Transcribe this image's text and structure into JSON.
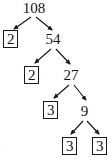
{
  "diagram": {
    "kind": "factor-tree",
    "root_value": "108",
    "ink_color": "#1a1a1a",
    "background_color": "#ffffff",
    "nodes": [
      {
        "id": "n108",
        "label": "108",
        "boxed": false,
        "prime": false,
        "level": 0,
        "x": 21,
        "y": 1,
        "w": 26,
        "h": 14
      },
      {
        "id": "n2a",
        "label": "2",
        "boxed": true,
        "prime": true,
        "level": 1,
        "x": 3,
        "y": 30,
        "w": 15,
        "h": 18
      },
      {
        "id": "n54",
        "label": "54",
        "boxed": false,
        "prime": false,
        "level": 1,
        "x": 44,
        "y": 32,
        "w": 18,
        "h": 14
      },
      {
        "id": "n2b",
        "label": "2",
        "boxed": true,
        "prime": true,
        "level": 2,
        "x": 24,
        "y": 66,
        "w": 15,
        "h": 18
      },
      {
        "id": "n27",
        "label": "27",
        "boxed": false,
        "prime": false,
        "level": 2,
        "x": 62,
        "y": 68,
        "w": 18,
        "h": 14
      },
      {
        "id": "n3a",
        "label": "3",
        "boxed": true,
        "prime": true,
        "level": 3,
        "x": 43,
        "y": 101,
        "w": 15,
        "h": 18
      },
      {
        "id": "n9",
        "label": "9",
        "boxed": false,
        "prime": false,
        "level": 3,
        "x": 79,
        "y": 104,
        "w": 11,
        "h": 14
      },
      {
        "id": "n3b",
        "label": "3",
        "boxed": true,
        "prime": true,
        "level": 4,
        "x": 62,
        "y": 137,
        "w": 15,
        "h": 18
      },
      {
        "id": "n3c",
        "label": "3",
        "boxed": true,
        "prime": true,
        "level": 4,
        "x": 92,
        "y": 137,
        "w": 15,
        "h": 18
      }
    ],
    "edges": [
      {
        "id": "e1",
        "from": "n108",
        "to": "n2a",
        "x1": 31,
        "y1": 17,
        "x2": 14,
        "y2": 29
      },
      {
        "id": "e2",
        "from": "n108",
        "to": "n54",
        "x1": 36,
        "y1": 17,
        "x2": 52,
        "y2": 30
      },
      {
        "id": "e3",
        "from": "n54",
        "to": "n2b",
        "x1": 51,
        "y1": 49,
        "x2": 35,
        "y2": 63
      },
      {
        "id": "e4",
        "from": "n54",
        "to": "n27",
        "x1": 56,
        "y1": 49,
        "x2": 70,
        "y2": 64
      },
      {
        "id": "e5",
        "from": "n27",
        "to": "n3a",
        "x1": 69,
        "y1": 85,
        "x2": 54,
        "y2": 98
      },
      {
        "id": "e6",
        "from": "n27",
        "to": "n9",
        "x1": 74,
        "y1": 85,
        "x2": 86,
        "y2": 100
      },
      {
        "id": "e7",
        "from": "n9",
        "to": "n3b",
        "x1": 83,
        "y1": 121,
        "x2": 71,
        "y2": 134
      },
      {
        "id": "e8",
        "from": "n9",
        "to": "n3c",
        "x1": 87,
        "y1": 121,
        "x2": 99,
        "y2": 134
      }
    ],
    "factorization": {
      "number": "108",
      "prime_factors": [
        "2",
        "2",
        "3",
        "3",
        "3"
      ],
      "steps": [
        {
          "from": "108",
          "into": [
            "2",
            "54"
          ]
        },
        {
          "from": "54",
          "into": [
            "2",
            "27"
          ]
        },
        {
          "from": "27",
          "into": [
            "3",
            "9"
          ]
        },
        {
          "from": "9",
          "into": [
            "3",
            "3"
          ]
        }
      ]
    }
  }
}
